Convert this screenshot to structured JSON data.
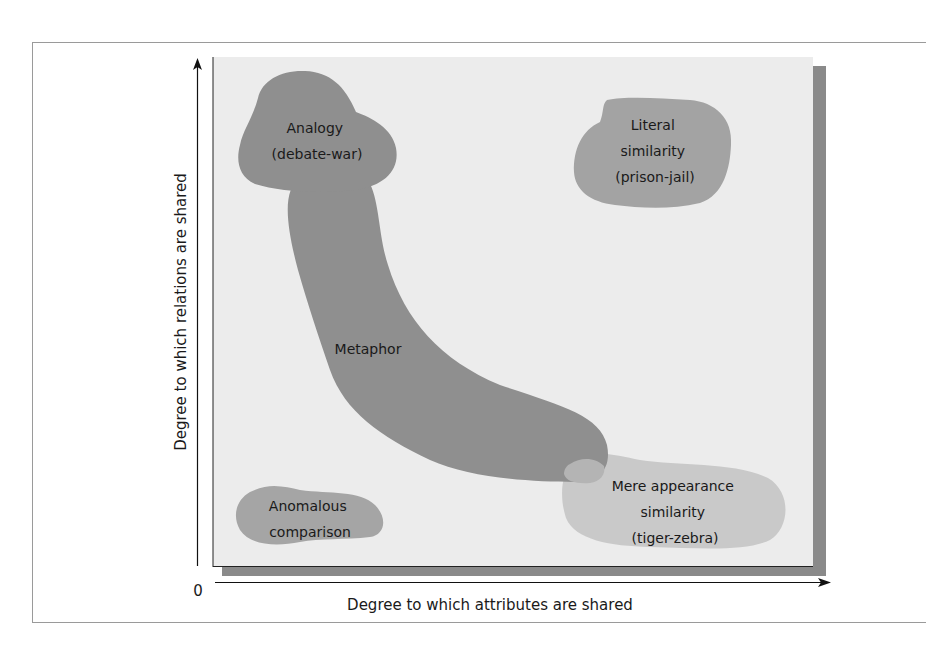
{
  "axes": {
    "y_label": "Degree to which relations are shared",
    "x_label": "Degree to which attributes are shared",
    "origin_label": "0"
  },
  "regions": [
    {
      "id": "analogy",
      "lines": [
        "Analogy",
        "(debate-war)"
      ],
      "color": "#8f8f8f"
    },
    {
      "id": "metaphor",
      "lines": [
        "Metaphor"
      ],
      "color": "#8f8f8f"
    },
    {
      "id": "literal",
      "lines": [
        "Literal",
        "similarity",
        "(prison-jail)"
      ],
      "color": "#a3a3a3"
    },
    {
      "id": "anomalous",
      "lines": [
        "Anomalous",
        "comparison"
      ],
      "color": "#a5a5a5"
    },
    {
      "id": "mere",
      "lines": [
        "Mere appearance",
        "similarity",
        "(tiger-zebra)"
      ],
      "color": "#c9c9c9"
    }
  ],
  "colors": {
    "panel": "#ececec",
    "shadow": "#8a8a8a",
    "axis": "#111111"
  }
}
